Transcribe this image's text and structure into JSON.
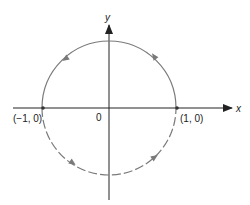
{
  "diagram": {
    "title": "",
    "axes": {
      "x_label": "x",
      "y_label": "y",
      "origin_label": "0"
    },
    "points": [
      {
        "id": "left",
        "label": "(−1, 0)",
        "coords": [
          -1,
          0
        ]
      },
      {
        "id": "right",
        "label": "(1, 0)",
        "coords": [
          1,
          0
        ]
      }
    ],
    "curves": [
      {
        "id": "upper-semicircle",
        "style": "solid",
        "direction": "counterclockwise",
        "from": [
          1,
          0
        ],
        "to": [
          -1,
          0
        ]
      },
      {
        "id": "lower-semicircle",
        "style": "dashed",
        "direction": "counterclockwise",
        "from": [
          -1,
          0
        ],
        "to": [
          1,
          0
        ]
      }
    ],
    "colors": {
      "axes": "#222222",
      "circle": "#7a7a7a",
      "points": "#333333"
    }
  }
}
